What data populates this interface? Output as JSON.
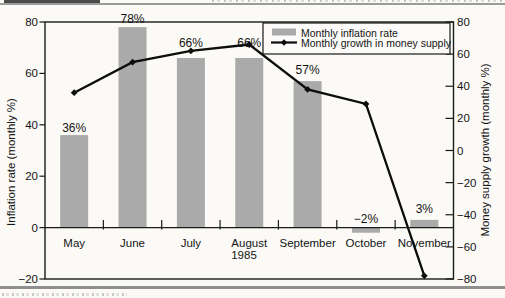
{
  "chart_data": {
    "type": "combo",
    "categories": [
      "May",
      "June",
      "July",
      "August",
      "September",
      "October",
      "November"
    ],
    "x_group_label": "1985",
    "series": [
      {
        "name": "Monthly inflation rate",
        "type": "bar",
        "axis": "left",
        "values": [
          36,
          78,
          66,
          66,
          57,
          -2,
          3
        ],
        "point_labels": [
          "36%",
          "78%",
          "66%",
          "66%",
          "57%",
          "−2%",
          "3%"
        ],
        "color": "#aaaaaa"
      },
      {
        "name": "Monthly growth in money supply",
        "type": "line",
        "axis": "right",
        "values": [
          36,
          55,
          62,
          66,
          38,
          29,
          -78
        ],
        "color": "#0d0d0d"
      }
    ],
    "left_axis": {
      "label": "Inflation rate (monthly %)",
      "min": -20,
      "max": 80,
      "ticks": [
        80,
        60,
        40,
        20,
        0,
        -20
      ]
    },
    "right_axis": {
      "label": "Money supply growth (monthly %)",
      "min": -80,
      "max": 80,
      "ticks": [
        80,
        60,
        40,
        20,
        0,
        -20,
        -40,
        -60,
        -80
      ]
    },
    "legend": {
      "position": "top-right",
      "entries": [
        "Monthly inflation rate",
        "Monthly growth in money supply"
      ]
    },
    "grid": false,
    "text_color": "#141414",
    "frame_color": "#1a1a1a"
  }
}
